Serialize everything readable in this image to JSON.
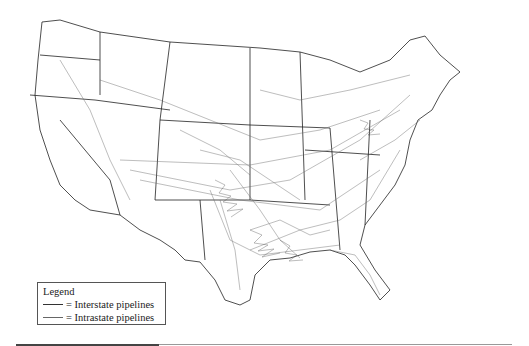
{
  "map": {
    "subject": "United States natural gas pipeline network",
    "colors": {
      "interstate": "#333333",
      "intrastate": "#777777",
      "border": "#222222",
      "background": "#ffffff"
    }
  },
  "legend": {
    "title": "Legend",
    "items": [
      {
        "label": "= Interstate pipelines",
        "symbol": "dark-line"
      },
      {
        "label": "= Intrastate pipelines",
        "symbol": "gray-line"
      }
    ]
  }
}
